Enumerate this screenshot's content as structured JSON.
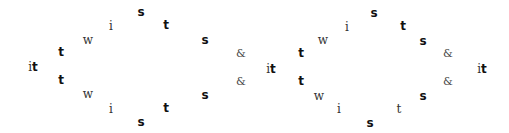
{
  "diagrams": [
    {
      "name": "diagram-left",
      "start": {
        "i": "i",
        "t": "t",
        "x": 33,
        "y": 66
      },
      "top_arc": [
        {
          "text": "t",
          "style": "bold",
          "x": 61,
          "y": 52
        },
        {
          "text": "w",
          "style": "serif",
          "x": 88,
          "y": 40
        },
        {
          "text": "i",
          "style": "serif",
          "x": 111,
          "y": 26
        },
        {
          "text": "s",
          "style": "bold",
          "x": 141,
          "y": 12
        },
        {
          "text": "t",
          "style": "bold",
          "x": 166,
          "y": 25
        },
        {
          "text": "s",
          "style": "bold",
          "x": 205,
          "y": 40
        },
        {
          "text": "&",
          "style": "amp",
          "x": 241,
          "y": 53
        }
      ],
      "bottom_arc": [
        {
          "text": "t",
          "style": "bold",
          "x": 61,
          "y": 80
        },
        {
          "text": "w",
          "style": "serif",
          "x": 88,
          "y": 94
        },
        {
          "text": "i",
          "style": "serif",
          "x": 111,
          "y": 109
        },
        {
          "text": "s",
          "style": "bold",
          "x": 141,
          "y": 122
        },
        {
          "text": "t",
          "style": "bold",
          "x": 166,
          "y": 108
        },
        {
          "text": "s",
          "style": "bold",
          "x": 205,
          "y": 95
        },
        {
          "text": "&",
          "style": "amp",
          "x": 241,
          "y": 81
        }
      ]
    },
    {
      "name": "diagram-right",
      "start": {
        "i": "i",
        "t": "t",
        "x": 271,
        "y": 68
      },
      "end": {
        "i": "i",
        "t": "t",
        "x": 482,
        "y": 68
      },
      "top_arc": [
        {
          "text": "t",
          "style": "bold",
          "x": 301,
          "y": 53
        },
        {
          "text": "w",
          "style": "serif",
          "x": 323,
          "y": 40
        },
        {
          "text": "i",
          "style": "serif",
          "x": 347,
          "y": 27
        },
        {
          "text": "s",
          "style": "bold",
          "x": 374,
          "y": 13
        },
        {
          "text": "t",
          "style": "bold",
          "x": 403,
          "y": 26
        },
        {
          "text": "s",
          "style": "bold",
          "x": 423,
          "y": 41
        },
        {
          "text": "&",
          "style": "amp",
          "x": 448,
          "y": 53
        }
      ],
      "bottom_arc": [
        {
          "text": "t",
          "style": "bold",
          "x": 301,
          "y": 81
        },
        {
          "text": "w",
          "style": "serif",
          "x": 319,
          "y": 96
        },
        {
          "text": "i",
          "style": "serif",
          "x": 339,
          "y": 109
        },
        {
          "text": "s",
          "style": "bold",
          "x": 370,
          "y": 123
        },
        {
          "text": "t",
          "style": "serif",
          "x": 399,
          "y": 109
        },
        {
          "text": "s",
          "style": "bold",
          "x": 423,
          "y": 96
        },
        {
          "text": "&",
          "style": "amp",
          "x": 448,
          "y": 81
        }
      ]
    }
  ]
}
